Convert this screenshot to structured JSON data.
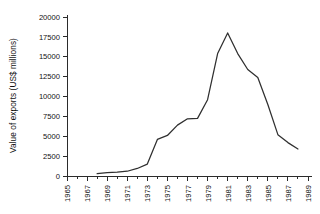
{
  "chart_data": {
    "type": "line",
    "title": "",
    "xlabel": "",
    "ylabel": "Value of exports (US$ millions)",
    "xlim": [
      1965,
      1989
    ],
    "ylim": [
      0,
      20000
    ],
    "grid": false,
    "legend": null,
    "x_tick_labels": [
      "1965",
      "1967",
      "1969",
      "1971",
      "1973",
      "1975",
      "1977",
      "1979",
      "1981",
      "1983",
      "1985",
      "1987",
      "1989"
    ],
    "x_tick_values": [
      1965,
      1967,
      1969,
      1971,
      1973,
      1975,
      1977,
      1979,
      1981,
      1983,
      1985,
      1987,
      1989
    ],
    "x_minor_tick_values": [
      1966,
      1968,
      1970,
      1972,
      1974,
      1976,
      1978,
      1980,
      1982,
      1984,
      1986,
      1988
    ],
    "y_tick_labels": [
      "0",
      "2500",
      "5000",
      "7500",
      "10000",
      "12500",
      "15000",
      "17500",
      "20000"
    ],
    "y_tick_values": [
      0,
      2500,
      5000,
      7500,
      10000,
      12500,
      15000,
      17500,
      20000
    ],
    "series": [
      {
        "name": "Value of exports",
        "color": "#2f2f2f",
        "x": [
          1968,
          1969,
          1970,
          1971,
          1972,
          1973,
          1974,
          1975,
          1976,
          1977,
          1978,
          1979,
          1980,
          1981,
          1982,
          1983,
          1984,
          1985,
          1986,
          1987,
          1988
        ],
        "values": [
          300,
          420,
          480,
          600,
          950,
          1500,
          4600,
          5100,
          6400,
          7200,
          7250,
          9600,
          15400,
          18000,
          15400,
          13400,
          12400,
          9000,
          5200,
          4200,
          3400
        ]
      }
    ]
  }
}
